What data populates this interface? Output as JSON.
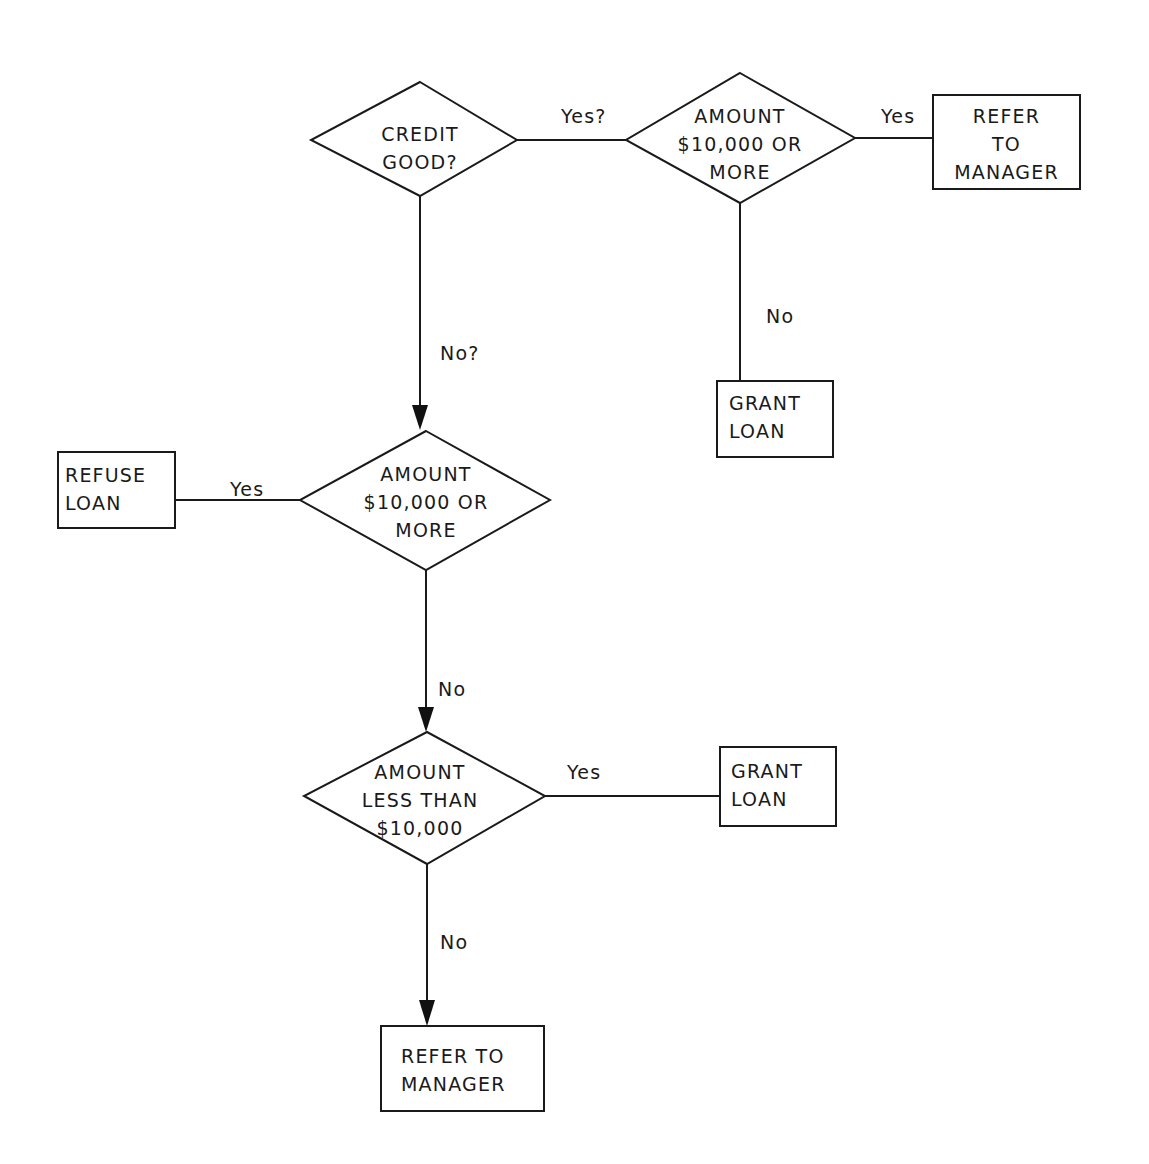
{
  "diagram": {
    "type": "flowchart",
    "nodes": {
      "credit_good": {
        "kind": "decision",
        "lines": [
          "CREDIT",
          "GOOD?"
        ]
      },
      "amount_top": {
        "kind": "decision",
        "lines": [
          "AMOUNT",
          "$10,000 OR",
          "MORE"
        ]
      },
      "refer_top": {
        "kind": "process",
        "lines": [
          "REFER",
          "TO",
          "MANAGER"
        ]
      },
      "grant_top": {
        "kind": "process",
        "lines": [
          "GRANT",
          "LOAN"
        ]
      },
      "amount_mid": {
        "kind": "decision",
        "lines": [
          "AMOUNT",
          "$10,000 OR",
          "MORE"
        ]
      },
      "refuse": {
        "kind": "process",
        "lines": [
          "REFUSE",
          "LOAN"
        ]
      },
      "amount_less": {
        "kind": "decision",
        "lines": [
          "AMOUNT",
          "LESS THAN",
          "$10,000"
        ]
      },
      "grant_bottom": {
        "kind": "process",
        "lines": [
          "GRANT",
          "LOAN"
        ]
      },
      "refer_bottom": {
        "kind": "process",
        "lines": [
          "REFER TO",
          "MANAGER"
        ]
      }
    },
    "edges": [
      {
        "from": "credit_good",
        "to": "amount_top",
        "label": "Yes?"
      },
      {
        "from": "amount_top",
        "to": "refer_top",
        "label": "Yes"
      },
      {
        "from": "amount_top",
        "to": "grant_top",
        "label": "No"
      },
      {
        "from": "credit_good",
        "to": "amount_mid",
        "label": "No?",
        "arrow": true
      },
      {
        "from": "amount_mid",
        "to": "refuse",
        "label": "Yes"
      },
      {
        "from": "amount_mid",
        "to": "amount_less",
        "label": "No",
        "arrow": true
      },
      {
        "from": "amount_less",
        "to": "grant_bottom",
        "label": "Yes"
      },
      {
        "from": "amount_less",
        "to": "refer_bottom",
        "label": "No",
        "arrow": true
      }
    ]
  },
  "text": {
    "credit_good": "CREDIT\nGOOD?",
    "amount_top": "AMOUNT\n$10,000 OR\nMORE",
    "refer_top": "REFER\nTO\nMANAGER",
    "grant_top": "GRANT\nLOAN",
    "amount_mid": "AMOUNT\n$10,000 OR\nMORE",
    "refuse": "REFUSE\nLOAN",
    "amount_less": "AMOUNT\nLESS THAN\n$10,000",
    "grant_bottom": "GRANT\nLOAN",
    "refer_bottom": "REFER TO\nMANAGER",
    "edge_yes_q": "Yes?",
    "edge_yes_top": "Yes",
    "edge_no_top": "No",
    "edge_no_q": "No?",
    "edge_yes_mid": "Yes",
    "edge_no_mid": "No",
    "edge_yes_less": "Yes",
    "edge_no_less": "No"
  }
}
